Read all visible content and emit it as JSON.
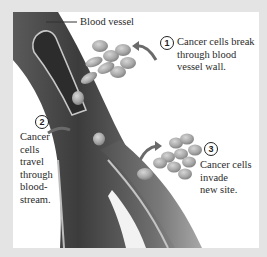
{
  "diagram": {
    "title_label": "Blood vessel",
    "steps": [
      {
        "number": "1",
        "text": "Cancer cells break\nthrough blood\nvessel wall."
      },
      {
        "number": "2",
        "text": "Cancer\ncells\ntravel\nthrough\nblood-\nstream."
      },
      {
        "number": "3",
        "text": "Cancer cells\ninvade\nnew site."
      }
    ],
    "colors": {
      "background": "#e4e4e4",
      "panel": "#ffffff",
      "vessel_dark": "#4a4a4a",
      "vessel_mid": "#7a7a7a",
      "vessel_light": "#b5b5b5",
      "cell": "#a9a9a9",
      "text": "#2a2a2a"
    }
  }
}
